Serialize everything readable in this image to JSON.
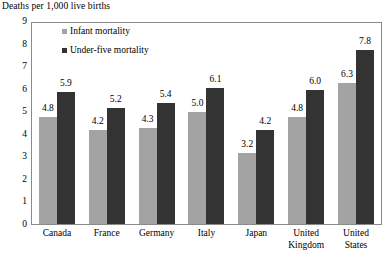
{
  "chart_data": {
    "type": "bar",
    "title": "Deaths per 1,000 live births",
    "xlabel": "",
    "ylabel": "Deaths per 1,000 live births",
    "ylim": [
      0,
      9
    ],
    "yticks": [
      0,
      1,
      2,
      3,
      4,
      5,
      6,
      7,
      8,
      9
    ],
    "grid": false,
    "legend_position": "top-left-inside",
    "categories": [
      "Canada",
      "France",
      "Germany",
      "Italy",
      "Japan",
      "United Kingdom",
      "United States"
    ],
    "series": [
      {
        "name": "Infant mortality",
        "color": "#a3a3a3",
        "values": [
          4.8,
          4.2,
          4.3,
          5.0,
          3.2,
          4.8,
          6.3
        ]
      },
      {
        "name": "Under-five mortality",
        "color": "#333333",
        "values": [
          5.9,
          5.2,
          5.4,
          6.1,
          4.2,
          6.0,
          7.8
        ]
      }
    ]
  },
  "axis": {
    "tick_labels": [
      "9",
      "8",
      "7",
      "6",
      "5",
      "4",
      "3",
      "2",
      "1",
      "0"
    ]
  },
  "category_lines": [
    [
      "Canada"
    ],
    [
      "France"
    ],
    [
      "Germany"
    ],
    [
      "Italy"
    ],
    [
      "Japan"
    ],
    [
      "United",
      "Kingdom"
    ],
    [
      "United",
      "States"
    ]
  ],
  "value_labels": {
    "infant": [
      "4.8",
      "4.2",
      "4.3",
      "5.0",
      "3.2",
      "4.8",
      "6.3"
    ],
    "underfive": [
      "5.9",
      "5.2",
      "5.4",
      "6.1",
      "4.2",
      "6.0",
      "7.8"
    ]
  }
}
